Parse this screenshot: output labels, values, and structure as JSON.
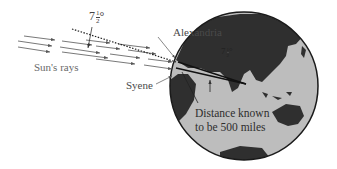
{
  "diagram": {
    "labels": {
      "alexandria": "Alexandria",
      "syene": "Syene",
      "suns_rays": "Sun's rays",
      "distance_line1": "Distance known",
      "distance_line2": "to be 500 miles",
      "angle_outer": {
        "whole": "7",
        "num": "1",
        "den": "2",
        "unit": "°"
      },
      "angle_inner": {
        "whole": "7",
        "num": "1",
        "den": "2",
        "unit": "°"
      }
    },
    "colors": {
      "ocean": "#bdbdbd",
      "land": "#2f2f2f",
      "outline": "#1a1a1a",
      "rays": "#555555",
      "text": "#4a4a4a"
    },
    "globe": {
      "cx": 244,
      "cy": 86,
      "r": 74
    }
  }
}
